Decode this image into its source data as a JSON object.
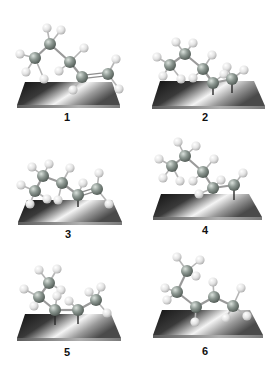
{
  "figure": {
    "width": 273,
    "height": 372,
    "colors": {
      "background": "#ffffff",
      "carbon": "#7f8a84",
      "carbon_highlight": "#c9d1cc",
      "hydrogen": "#e4e4e4",
      "hydrogen_highlight": "#ffffff",
      "bond": "#9a9a9a",
      "plate_dark": "#151515",
      "plate_light": "#f2f2f2",
      "plate_edge": "#8a8a8a",
      "label": "#111111"
    },
    "panels": [
      {
        "label": "1",
        "label_pos": [
          67,
          121
        ],
        "plate": {
          "top": 82,
          "bottom": 105,
          "tl": 25,
          "tr": 112,
          "bl": 17,
          "br": 120
        },
        "carbons": [
          [
            35,
            58
          ],
          [
            50,
            44
          ],
          [
            70,
            62
          ],
          [
            82,
            77
          ],
          [
            108,
            74
          ]
        ],
        "double_bond": [
          3,
          4
        ],
        "hydrogens": [
          [
            20,
            54
          ],
          [
            26,
            72
          ],
          [
            44,
            79
          ],
          [
            47,
            28
          ],
          [
            61,
            30
          ],
          [
            84,
            48
          ],
          [
            59,
            71
          ],
          [
            73,
            90
          ],
          [
            116,
            59
          ],
          [
            119,
            89
          ]
        ],
        "h_bonds": [
          [
            0,
            0
          ],
          [
            0,
            1
          ],
          [
            0,
            2
          ],
          [
            1,
            3
          ],
          [
            1,
            4
          ],
          [
            2,
            5
          ],
          [
            2,
            6
          ],
          [
            3,
            7
          ],
          [
            4,
            8
          ],
          [
            4,
            9
          ]
        ],
        "anchors": []
      },
      {
        "label": "2",
        "label_pos": [
          205,
          121
        ],
        "plate": {
          "top": 81,
          "bottom": 106,
          "tl": 160,
          "tr": 254,
          "bl": 152,
          "br": 265
        },
        "carbons": [
          [
            170,
            65
          ],
          [
            185,
            54
          ],
          [
            203,
            69
          ],
          [
            213,
            83
          ],
          [
            232,
            79
          ]
        ],
        "double_bond": null,
        "hydrogens": [
          [
            157,
            57
          ],
          [
            163,
            76
          ],
          [
            181,
            79
          ],
          [
            176,
            42
          ],
          [
            193,
            43
          ],
          [
            212,
            55
          ],
          [
            193,
            78
          ],
          [
            224,
            74
          ],
          [
            227,
            67
          ],
          [
            244,
            70
          ]
        ],
        "h_bonds": [
          [
            0,
            0
          ],
          [
            0,
            1
          ],
          [
            0,
            2
          ],
          [
            1,
            3
          ],
          [
            1,
            4
          ],
          [
            2,
            5
          ],
          [
            2,
            6
          ],
          [
            3,
            7
          ],
          [
            4,
            8
          ],
          [
            4,
            9
          ]
        ],
        "anchors": [
          [
            213,
            83,
            95
          ],
          [
            232,
            79,
            93
          ]
        ]
      },
      {
        "label": "3",
        "label_pos": [
          68,
          238
        ],
        "plate": {
          "top": 200,
          "bottom": 222,
          "tl": 27,
          "tr": 112,
          "bl": 18,
          "br": 122
        },
        "carbons": [
          [
            35,
            191
          ],
          [
            43,
            176
          ],
          [
            62,
            183
          ],
          [
            78,
            195
          ],
          [
            97,
            189
          ]
        ],
        "double_bond": [
          3,
          4
        ],
        "hydrogens": [
          [
            21,
            185
          ],
          [
            30,
            204
          ],
          [
            47,
            199
          ],
          [
            32,
            167
          ],
          [
            49,
            164
          ],
          [
            70,
            168
          ],
          [
            58,
            200
          ],
          [
            83,
            183
          ],
          [
            99,
            173
          ],
          [
            109,
            204
          ]
        ],
        "h_bonds": [
          [
            0,
            0
          ],
          [
            0,
            1
          ],
          [
            0,
            2
          ],
          [
            1,
            3
          ],
          [
            1,
            4
          ],
          [
            2,
            5
          ],
          [
            2,
            6
          ],
          [
            3,
            7
          ],
          [
            4,
            8
          ],
          [
            4,
            9
          ]
        ],
        "anchors": [
          [
            78,
            195,
            207
          ]
        ]
      },
      {
        "label": "4",
        "label_pos": [
          205,
          234
        ],
        "plate": {
          "top": 194,
          "bottom": 217,
          "tl": 161,
          "tr": 249,
          "bl": 153,
          "br": 262
        },
        "carbons": [
          [
            172,
            166
          ],
          [
            185,
            156
          ],
          [
            203,
            172
          ],
          [
            213,
            188
          ],
          [
            234,
            185
          ]
        ],
        "double_bond": null,
        "hydrogens": [
          [
            159,
            159
          ],
          [
            163,
            178
          ],
          [
            180,
            181
          ],
          [
            178,
            142
          ],
          [
            196,
            146
          ],
          [
            214,
            159
          ],
          [
            193,
            181
          ],
          [
            199,
            194
          ],
          [
            221,
            180
          ],
          [
            243,
            173
          ]
        ],
        "h_bonds": [
          [
            0,
            0
          ],
          [
            0,
            1
          ],
          [
            0,
            2
          ],
          [
            1,
            3
          ],
          [
            1,
            4
          ],
          [
            2,
            5
          ],
          [
            2,
            6
          ],
          [
            3,
            7
          ],
          [
            3,
            8
          ],
          [
            4,
            9
          ]
        ],
        "anchors": [
          [
            234,
            185,
            200
          ]
        ]
      },
      {
        "label": "5",
        "label_pos": [
          67,
          356
        ],
        "plate": {
          "top": 314,
          "bottom": 338,
          "tl": 25,
          "tr": 111,
          "bl": 17,
          "br": 121
        },
        "carbons": [
          [
            49,
            283
          ],
          [
            39,
            297
          ],
          [
            55,
            310
          ],
          [
            78,
            310
          ],
          [
            96,
            300
          ]
        ],
        "double_bond": null,
        "hydrogens": [
          [
            39,
            270
          ],
          [
            57,
            269
          ],
          [
            61,
            290
          ],
          [
            24,
            289
          ],
          [
            34,
            306
          ],
          [
            57,
            296
          ],
          [
            69,
            301
          ],
          [
            101,
            287
          ],
          [
            89,
            292
          ],
          [
            107,
            313
          ]
        ],
        "h_bonds": [
          [
            0,
            0
          ],
          [
            0,
            1
          ],
          [
            0,
            2
          ],
          [
            1,
            3
          ],
          [
            1,
            4
          ],
          [
            2,
            5
          ],
          [
            3,
            6
          ],
          [
            4,
            7
          ],
          [
            4,
            8
          ],
          [
            4,
            9
          ]
        ],
        "anchors": [
          [
            55,
            310,
            325
          ],
          [
            78,
            310,
            324
          ]
        ]
      },
      {
        "label": "6",
        "label_pos": [
          205,
          355
        ],
        "plate": {
          "top": 310,
          "bottom": 335,
          "tl": 162,
          "tr": 250,
          "bl": 153,
          "br": 263
        },
        "carbons": [
          [
            187,
            271
          ],
          [
            177,
            292
          ],
          [
            196,
            307
          ],
          [
            214,
            297
          ],
          [
            233,
            306
          ]
        ],
        "double_bond": null,
        "hydrogens": [
          [
            177,
            257
          ],
          [
            200,
            260
          ],
          [
            196,
            276
          ],
          [
            165,
            288
          ],
          [
            167,
            300
          ],
          [
            195,
            322
          ],
          [
            213,
            282
          ],
          [
            241,
            288
          ],
          [
            226,
            318
          ],
          [
            247,
            316
          ]
        ],
        "h_bonds": [
          [
            0,
            0
          ],
          [
            0,
            1
          ],
          [
            0,
            2
          ],
          [
            1,
            3
          ],
          [
            1,
            4
          ],
          [
            2,
            5
          ],
          [
            3,
            6
          ],
          [
            4,
            7
          ],
          [
            4,
            8
          ],
          [
            4,
            9
          ]
        ],
        "anchors": []
      }
    ]
  }
}
